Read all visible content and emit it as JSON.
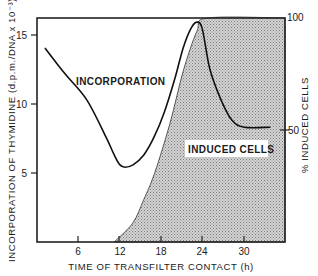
{
  "chart_data": {
    "type": "line",
    "title": "",
    "xlabel": "TIME OF TRANSFILTER CONTACT (h)",
    "ylabel": "INCORPORATION OF THYMIDINE (d.p.m./DNA x 10⁻³)",
    "y2label": "% INDUCED CELLS",
    "xlim": [
      0,
      36
    ],
    "ylim": [
      0,
      16.2
    ],
    "y2lim": [
      0,
      100
    ],
    "xticks": [
      6,
      12,
      18,
      24,
      30
    ],
    "yticks": [
      5,
      10,
      15
    ],
    "y2ticks": [
      50,
      100
    ],
    "grid": false,
    "legend": "none (inline annotations)",
    "series": [
      {
        "name": "INCORPORATION",
        "axis": "left",
        "style": "line",
        "x": [
          1.2,
          4.0,
          7.2,
          10.0,
          11.2,
          12.0,
          12.8,
          14.0,
          15.5,
          17.0,
          18.5,
          20.0,
          21.2,
          22.3,
          23.2,
          24.0,
          25.1,
          26.7,
          28.3,
          30.1,
          33.8
        ],
        "y": [
          14.0,
          12.2,
          10.3,
          7.6,
          6.3,
          5.6,
          5.4,
          5.6,
          6.3,
          7.6,
          9.4,
          11.8,
          14.0,
          15.4,
          15.9,
          15.4,
          12.5,
          10.3,
          8.8,
          8.3,
          8.3
        ]
      },
      {
        "name": "INDUCED CELLS",
        "axis": "right",
        "style": "shaded area",
        "x": [
          11.2,
          13.9,
          15.5,
          17.1,
          19.3,
          21.2,
          23.2,
          24.8,
          36.0
        ],
        "y": [
          0,
          8.5,
          19,
          31,
          53,
          76,
          94,
          100,
          100
        ]
      }
    ],
    "annotations": [
      {
        "text": "INCORPORATION",
        "x": 5.5,
        "y": 11.7
      },
      {
        "text": "INDUCED CELLS",
        "x": 21.5,
        "y2": 41
      }
    ]
  },
  "labels": {
    "xlabel": "TIME OF TRANSFILTER CONTACT (h)",
    "ylabel": "INCORPORATION OF THYMIDINE (d.p.m./DNA x 10⁻³)",
    "y2label": "% INDUCED CELLS",
    "annot_incorporation": "INCORPORATION",
    "annot_induced": "INDUCED CELLS",
    "xtick_6": "6",
    "xtick_12": "12",
    "xtick_18": "18",
    "xtick_24": "24",
    "xtick_30": "30",
    "ytick_5": "5",
    "ytick_10": "10",
    "ytick_15": "15",
    "y2tick_50": "50",
    "y2tick_100": "100"
  }
}
